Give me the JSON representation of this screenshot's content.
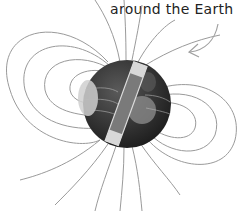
{
  "caption": {
    "text": "around the Earth"
  },
  "diagram": {
    "elements": [
      "earth-globe",
      "bar-magnet",
      "magnetic-field-lines",
      "pointer-arrow"
    ],
    "colors": {
      "lines": "#9a9a9a",
      "globe": "#3a3a3a",
      "magnet": "#8a8a8a",
      "text": "#222222"
    }
  }
}
